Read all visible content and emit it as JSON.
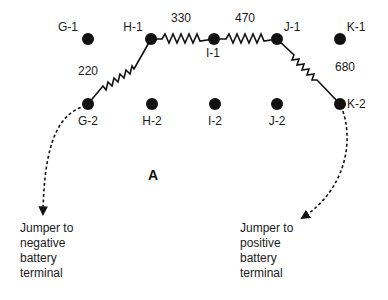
{
  "figure_label": "A",
  "colors": {
    "ink": "#111111",
    "background": "#ffffff"
  },
  "terminals": [
    {
      "id": "G-1",
      "x": 88,
      "y": 39,
      "lx": 68,
      "ly": 31,
      "anchor": "middle"
    },
    {
      "id": "H-1",
      "x": 151,
      "y": 39,
      "lx": 133,
      "ly": 31,
      "anchor": "middle"
    },
    {
      "id": "I-1",
      "x": 214,
      "y": 39,
      "lx": 213,
      "ly": 57,
      "anchor": "middle"
    },
    {
      "id": "J-1",
      "x": 277,
      "y": 39,
      "lx": 292,
      "ly": 31,
      "anchor": "middle"
    },
    {
      "id": "K-1",
      "x": 340,
      "y": 39,
      "lx": 356,
      "ly": 31,
      "anchor": "middle"
    },
    {
      "id": "G-2",
      "x": 88,
      "y": 104,
      "lx": 88,
      "ly": 125,
      "anchor": "middle"
    },
    {
      "id": "H-2",
      "x": 152,
      "y": 104,
      "lx": 152,
      "ly": 125,
      "anchor": "middle"
    },
    {
      "id": "I-2",
      "x": 215,
      "y": 104,
      "lx": 215,
      "ly": 125,
      "anchor": "middle"
    },
    {
      "id": "J-2",
      "x": 277,
      "y": 104,
      "lx": 277,
      "ly": 125,
      "anchor": "middle"
    },
    {
      "id": "K-2",
      "x": 340,
      "y": 104,
      "lx": 347,
      "ly": 108,
      "anchor": "start"
    }
  ],
  "resistors": [
    {
      "value": "220",
      "from": "G-2",
      "to": "H-1",
      "lx": 88,
      "ly": 75
    },
    {
      "value": "330",
      "from": "H-1",
      "to": "I-1",
      "lx": 181,
      "ly": 22
    },
    {
      "value": "470",
      "from": "I-1",
      "to": "J-1",
      "lx": 245,
      "ly": 22
    },
    {
      "value": "680",
      "from": "J-1",
      "to": "K-2",
      "lx": 345,
      "ly": 71
    }
  ],
  "jumpers": [
    {
      "from": "G-2",
      "label": "Jumper to\nnegative\nbattery\nterminal"
    },
    {
      "from": "K-2",
      "label": "Jumper to\npositive\nbattery\nterminal"
    }
  ]
}
